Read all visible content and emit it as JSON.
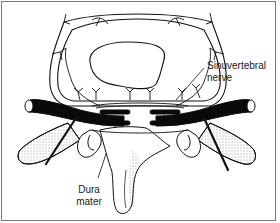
{
  "figure": {
    "type": "anatomical-diagram",
    "labels": [
      {
        "id": "sinuvertebral",
        "text": "Sinuvertebral\nnerve"
      },
      {
        "id": "dura",
        "text": "Dura\nmater"
      }
    ],
    "colors": {
      "frame": "#7a7a7a",
      "ink": "#111111",
      "background": "#ffffff"
    }
  }
}
